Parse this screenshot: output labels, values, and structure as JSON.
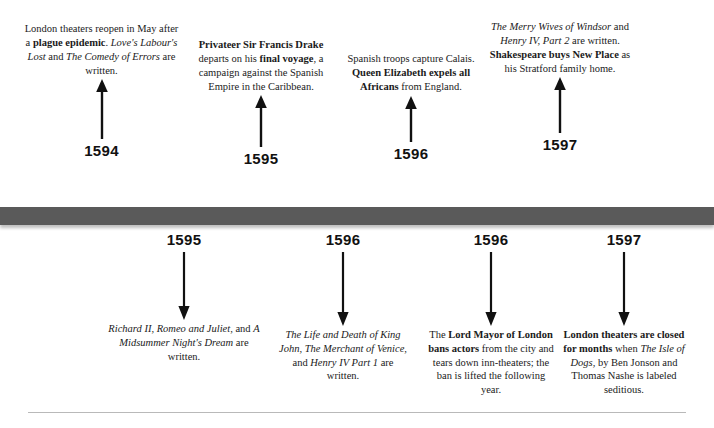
{
  "timeline": {
    "axis_color": "#5a5a5a",
    "top_events": [
      {
        "year": "1594",
        "html": "London theaters reopen in May after a <b>plague epidemic</b>. <i>Love's Labour's Lost</i> and <i>The Comedy of Errors</i> are written."
      },
      {
        "year": "1595",
        "html": "<b>Privateer Sir Francis Drake</b> departs on his <b>final voyage</b>, a campaign against the Spanish Empire in the Caribbean."
      },
      {
        "year": "1596",
        "html": "Spanish troops capture Calais. <b>Queen Elizabeth expels all Africans</b> from England."
      },
      {
        "year": "1597",
        "html": "<i>The Merry Wives of Windsor</i> and <i>Henry IV, Part 2</i> are written. <b>Shakespeare buys New Place</b> as his Stratford family home."
      }
    ],
    "bottom_events": [
      {
        "year": "1595",
        "html": "<i>Richard II, Romeo and Juliet,</i> and <i>A Midsummer Night's Dream</i> are written."
      },
      {
        "year": "1596",
        "html": "<i>The Life and Death of King John, The Merchant of Venice,</i> and <i>Henry IV Part 1</i> are written."
      },
      {
        "year": "1596",
        "html": "The <b>Lord Mayor of London bans actors</b> from the city and tears down inn-theaters; the ban is lifted the following year."
      },
      {
        "year": "1597",
        "html": "<b>London theaters are closed for months</b> when <i>The Isle of Dogs</i>, by Ben Jonson and Thomas Nashe is labeled seditious."
      }
    ]
  }
}
